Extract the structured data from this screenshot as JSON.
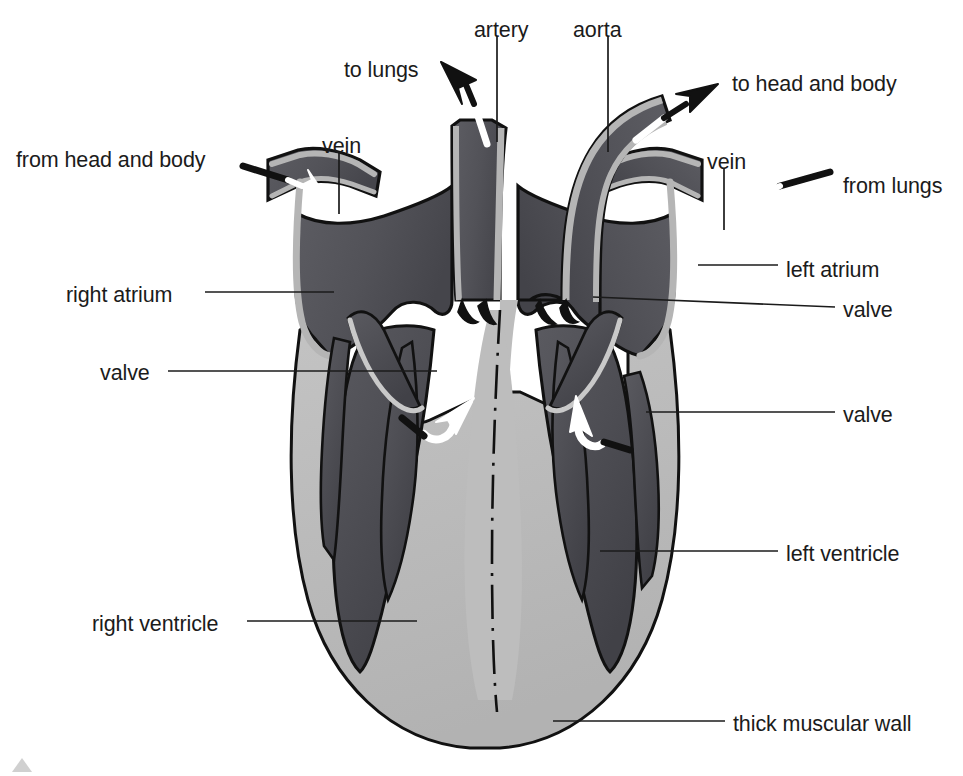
{
  "diagram": {
    "type": "anatomical-cross-section",
    "background_color": "#ffffff",
    "palette": {
      "blood_chamber": "#56565c",
      "blood_chamber_dark": "#4a4a50",
      "muscle_wall": "#bdbdbd",
      "vessel_wall": "#b5b5b5",
      "outline": "#111111",
      "arrow_white": "#ffffff",
      "arrow_black": "#111111",
      "leader_line": "#1b1b1b",
      "text": "#1b1b1b"
    },
    "labels": [
      {
        "id": "to-lungs",
        "text": "to lungs",
        "x": 344,
        "y": 60,
        "align": "left"
      },
      {
        "id": "artery",
        "text": "artery",
        "x": 474,
        "y": 20,
        "align": "left"
      },
      {
        "id": "aorta",
        "text": "aorta",
        "x": 573,
        "y": 20,
        "align": "left"
      },
      {
        "id": "to-head-and-body",
        "text": "to head and body",
        "x": 732,
        "y": 74,
        "align": "left"
      },
      {
        "id": "vein-left",
        "text": "vein",
        "x": 322,
        "y": 136,
        "align": "left"
      },
      {
        "id": "from-head-and-body",
        "text": "from head and body",
        "x": 16,
        "y": 150,
        "align": "left"
      },
      {
        "id": "vein-right",
        "text": "vein",
        "x": 707,
        "y": 152,
        "align": "left"
      },
      {
        "id": "from-lungs",
        "text": "from lungs",
        "x": 843,
        "y": 176,
        "align": "left"
      },
      {
        "id": "left-atrium",
        "text": "left atrium",
        "x": 786,
        "y": 260,
        "align": "left"
      },
      {
        "id": "right-atrium",
        "text": "right atrium",
        "x": 66,
        "y": 285,
        "align": "left"
      },
      {
        "id": "valve-right-upper",
        "text": "valve",
        "x": 843,
        "y": 300,
        "align": "left"
      },
      {
        "id": "valve-left",
        "text": "valve",
        "x": 100,
        "y": 363,
        "align": "left"
      },
      {
        "id": "valve-right-lower",
        "text": "valve",
        "x": 843,
        "y": 405,
        "align": "left"
      },
      {
        "id": "left-ventricle",
        "text": "left ventricle",
        "x": 786,
        "y": 544,
        "align": "left"
      },
      {
        "id": "right-ventricle",
        "text": "right ventricle",
        "x": 92,
        "y": 614,
        "align": "left"
      },
      {
        "id": "thick-muscular-wall",
        "text": "thick muscular wall",
        "x": 733,
        "y": 714,
        "align": "left"
      }
    ],
    "leader_lines": [
      {
        "id": "leader-artery",
        "points": "497,36 497,140"
      },
      {
        "id": "leader-aorta",
        "points": "608,36 608,150"
      },
      {
        "id": "leader-vein-left",
        "points": "339,152 339,212"
      },
      {
        "id": "leader-vein-right",
        "points": "724,168 724,228"
      },
      {
        "id": "leader-right-atrium",
        "points": "205,292 332,292"
      },
      {
        "id": "leader-left-atrium",
        "points": "778,265 700,265"
      },
      {
        "id": "leader-valve-right-upper",
        "points": "835,308 592,296"
      },
      {
        "id": "leader-valve-left",
        "points": "168,371 437,371"
      },
      {
        "id": "leader-valve-right-lower",
        "points": "835,413 645,413"
      },
      {
        "id": "leader-left-ventricle",
        "points": "778,551 599,551"
      },
      {
        "id": "leader-right-ventricle",
        "points": "247,621 417,621"
      },
      {
        "id": "leader-thick-muscular-wall",
        "points": "725,721 552,721"
      }
    ],
    "flow_arrows": [
      {
        "id": "arrow-to-lungs",
        "direction": "up-left",
        "color_outer": "#111111",
        "color_inner": "#ffffff",
        "meaning": "deoxygenated blood leaves to lungs"
      },
      {
        "id": "arrow-to-head-and-body",
        "direction": "up-right",
        "color_outer": "#111111",
        "color_inner": "#ffffff",
        "meaning": "oxygenated blood leaves to head and body"
      },
      {
        "id": "arrow-from-head-and-body",
        "direction": "down-right",
        "color_outer": "#111111",
        "color_inner": "#ffffff",
        "meaning": "deoxygenated blood enters right atrium"
      },
      {
        "id": "arrow-from-lungs",
        "direction": "down-left",
        "color_outer": "#111111",
        "color_inner": "#ffffff",
        "meaning": "oxygenated blood enters left atrium"
      },
      {
        "id": "arrow-right-valve-flow",
        "direction": "curve-up-right",
        "color_outer": "#ffffff",
        "color_inner": "#ffffff",
        "meaning": "blood pushed from right ventricle through valve"
      },
      {
        "id": "arrow-left-valve-flow",
        "direction": "curve-up-left",
        "color_outer": "#ffffff",
        "color_inner": "#ffffff",
        "meaning": "blood pushed from left ventricle through valve"
      }
    ],
    "structures": [
      "right atrium",
      "left atrium",
      "right ventricle",
      "left ventricle",
      "artery",
      "aorta",
      "vein",
      "valve",
      "thick muscular wall",
      "septum"
    ]
  }
}
